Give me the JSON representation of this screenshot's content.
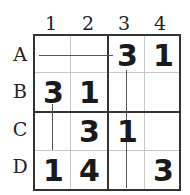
{
  "puzzle": {
    "columns": [
      "1",
      "2",
      "3",
      "4"
    ],
    "rows": [
      "A",
      "B",
      "C",
      "D"
    ],
    "cells": [
      [
        "",
        "",
        "3",
        "1"
      ],
      [
        "3",
        "1",
        "",
        ""
      ],
      [
        "",
        "3",
        "1",
        ""
      ],
      [
        "1",
        "4",
        "",
        "3"
      ]
    ],
    "connectors": [
      {
        "id": "A-horizontal",
        "from": "A1",
        "to": "A3",
        "orientation": "horizontal"
      },
      {
        "id": "col3-vertical",
        "from": "A3",
        "to": "D3",
        "orientation": "vertical"
      },
      {
        "id": "col1-vertical",
        "from": "B1",
        "to": "C1",
        "orientation": "vertical"
      }
    ]
  }
}
